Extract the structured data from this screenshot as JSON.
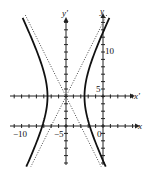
{
  "diagram": {
    "type": "hyperbola-with-translated-axes",
    "center": {
      "x": -5,
      "y": 4
    },
    "a": 2.5,
    "asymptote_slope": 2,
    "axes": {
      "x_label": "x",
      "y_label": "y",
      "x_prime_label": "x'",
      "y_prime_label": "y'"
    },
    "tick_labels": {
      "x_neg10": "−10",
      "x_neg5": "−5",
      "x_0": "0",
      "y_5": "5",
      "y_10": "10"
    },
    "colors": {
      "curve": "#111111",
      "axes": "#222222",
      "asymptote": "#333333"
    }
  }
}
